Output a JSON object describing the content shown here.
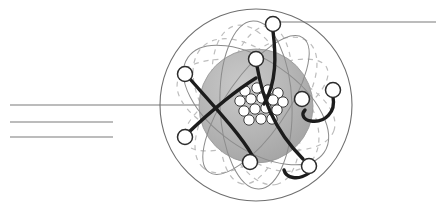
{
  "figure": {
    "type": "scientific-illustration",
    "width": 442,
    "height": 209,
    "background_color": "#ffffff"
  },
  "colors": {
    "background": "#ffffff",
    "outer_shell_stroke": "#6f6f6f",
    "nucleus_sphere_fill": "#b3b3b3",
    "nucleus_sphere_stroke": "#9a9a9a",
    "nucleon_fill": "#ffffff",
    "nucleon_stroke": "#3c3c3c",
    "electron_fill": "#ffffff",
    "electron_stroke": "#2b2b2b",
    "orbit_dashed_stroke": "#bdbdbd",
    "orbit_solid_stroke": "#8c8c8c",
    "electron_path_dark": "#1c1c1c",
    "leader_line_stroke": "#7a7a7a"
  },
  "atom": {
    "center": {
      "x": 256,
      "y": 105
    },
    "outer_shell_radius": 96,
    "nucleus_sphere": {
      "cx": 256,
      "cy": 106,
      "r": 57
    },
    "label_outer_shell": "outer electron shell boundary",
    "label_nucleus": "nucleus",
    "label_electron": "electron",
    "label_nucleon": "nucleon"
  },
  "nucleons": [
    {
      "cx": 245,
      "cy": 91,
      "r": 5.2
    },
    {
      "cx": 257,
      "cy": 88,
      "r": 5.2
    },
    {
      "cx": 268,
      "cy": 90,
      "r": 5.2
    },
    {
      "cx": 278,
      "cy": 93,
      "r": 5.2
    },
    {
      "cx": 240,
      "cy": 101,
      "r": 5.2
    },
    {
      "cx": 251,
      "cy": 99,
      "r": 5.2
    },
    {
      "cx": 262,
      "cy": 98,
      "r": 5.2
    },
    {
      "cx": 273,
      "cy": 100,
      "r": 5.2
    },
    {
      "cx": 283,
      "cy": 102,
      "r": 5.2
    },
    {
      "cx": 244,
      "cy": 111,
      "r": 5.2
    },
    {
      "cx": 255,
      "cy": 109,
      "r": 5.2
    },
    {
      "cx": 266,
      "cy": 108,
      "r": 5.2
    },
    {
      "cx": 277,
      "cy": 110,
      "r": 5.2
    },
    {
      "cx": 249,
      "cy": 120,
      "r": 5.2
    },
    {
      "cx": 261,
      "cy": 119,
      "r": 5.2
    },
    {
      "cx": 272,
      "cy": 119,
      "r": 5.2
    }
  ],
  "electrons": [
    {
      "id": "electron-top",
      "cx": 273,
      "cy": 24,
      "r": 7.5
    },
    {
      "id": "electron-upper-left",
      "cx": 185,
      "cy": 74,
      "r": 7.5
    },
    {
      "id": "electron-upper-mid",
      "cx": 256,
      "cy": 59,
      "r": 7.5
    },
    {
      "id": "electron-right-outer",
      "cx": 333,
      "cy": 90,
      "r": 7.5
    },
    {
      "id": "electron-right-inner",
      "cx": 302,
      "cy": 99,
      "r": 7.5
    },
    {
      "id": "electron-lower-left",
      "cx": 185,
      "cy": 137,
      "r": 7.5
    },
    {
      "id": "electron-bottom-mid",
      "cx": 250,
      "cy": 162,
      "r": 7.5
    },
    {
      "id": "electron-bottom-right",
      "cx": 309,
      "cy": 166,
      "r": 7.5
    }
  ],
  "electron_paths": [
    {
      "id": "path-top-to-center",
      "d": "M 273 31 C 276 55 277 82 264 104"
    },
    {
      "id": "path-upper-left-to-lower",
      "d": "M 190 79 C 212 104 240 134 252 155"
    },
    {
      "id": "path-upper-mid-down",
      "d": "M 257 66 C 262 95 272 128 303 159"
    },
    {
      "id": "path-lower-left-up",
      "d": "M 189 132 C 208 114 232 93 256 78"
    },
    {
      "id": "path-right-hook",
      "d": "M 333 97 C 336 112 325 123 311 121 C 303 120 301 114 305 110"
    },
    {
      "id": "path-bottom-hook",
      "d": "M 309 173 C 298 181 286 178 284 170"
    }
  ],
  "dashed_orbits": [
    {
      "id": "orbit-dashed-1",
      "cx": 256,
      "cy": 105,
      "rx": 82,
      "ry": 40,
      "rotate": 18
    },
    {
      "id": "orbit-dashed-2",
      "cx": 256,
      "cy": 105,
      "rx": 82,
      "ry": 40,
      "rotate": 75
    },
    {
      "id": "orbit-dashed-3",
      "cx": 256,
      "cy": 105,
      "rx": 82,
      "ry": 40,
      "rotate": 130
    },
    {
      "id": "orbit-dashed-4",
      "cx": 256,
      "cy": 105,
      "rx": 80,
      "ry": 34,
      "rotate": 100
    },
    {
      "id": "orbit-dashed-5",
      "cx": 256,
      "cy": 105,
      "rx": 79,
      "ry": 46,
      "rotate": 48
    },
    {
      "id": "orbit-dashed-6",
      "cx": 256,
      "cy": 105,
      "rx": 80,
      "ry": 30,
      "rotate": 152
    }
  ],
  "solid_orbits": [
    {
      "id": "orbit-solid-1",
      "cx": 256,
      "cy": 105,
      "rx": 84,
      "ry": 36,
      "rotate": 88
    },
    {
      "id": "orbit-solid-2",
      "cx": 256,
      "cy": 105,
      "rx": 83,
      "ry": 44,
      "rotate": 35
    },
    {
      "id": "orbit-solid-3",
      "cx": 256,
      "cy": 105,
      "rx": 82,
      "ry": 30,
      "rotate": 125
    }
  ],
  "leader_lines": [
    {
      "id": "leader-left-1",
      "x1": 10,
      "y1": 105,
      "x2": 260,
      "y2": 105,
      "stroke_width": 1.1
    },
    {
      "id": "leader-left-2",
      "x1": 10,
      "y1": 122,
      "x2": 113,
      "y2": 122,
      "stroke_width": 1.1
    },
    {
      "id": "leader-left-3",
      "x1": 10,
      "y1": 137,
      "x2": 113,
      "y2": 137,
      "stroke_width": 1.1
    },
    {
      "id": "leader-right-top",
      "x1": 276,
      "y1": 22,
      "x2": 436,
      "y2": 22,
      "stroke_width": 1.1
    }
  ]
}
